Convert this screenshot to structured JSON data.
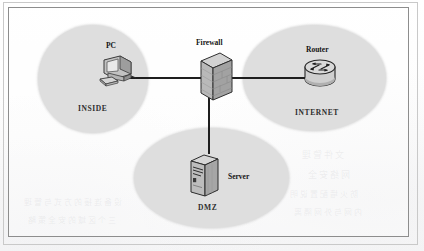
{
  "diagram": {
    "zones": [
      {
        "id": "inside",
        "label": "INSIDE"
      },
      {
        "id": "internet",
        "label": "INTERNET"
      },
      {
        "id": "dmz",
        "label": "DMZ"
      }
    ],
    "nodes": [
      {
        "id": "pc",
        "label": "PC",
        "icon": "desktop-computer-icon"
      },
      {
        "id": "firewall",
        "label": "Firewall",
        "icon": "firewall-brick-wall-icon"
      },
      {
        "id": "router",
        "label": "Router",
        "icon": "router-cylinder-icon"
      },
      {
        "id": "server",
        "label": "Server",
        "icon": "server-tower-icon"
      }
    ],
    "links": [
      {
        "from": "pc",
        "to": "firewall"
      },
      {
        "from": "firewall",
        "to": "router"
      },
      {
        "from": "firewall",
        "to": "server"
      }
    ],
    "colors": {
      "zone_fill": "#dedede",
      "line": "#1e1e1e",
      "frame": "#8d8d8d",
      "text": "#141414",
      "page": "#fdfdfd"
    }
  }
}
